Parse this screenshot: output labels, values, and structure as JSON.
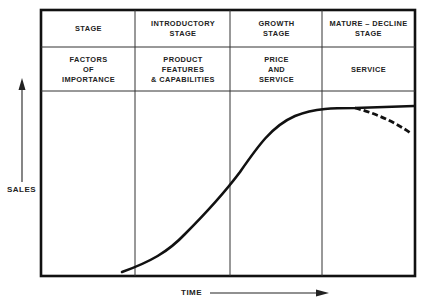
{
  "header_row": {
    "row_label": "STAGE",
    "stages": [
      "INTRODUCTORY\nSTAGE",
      "GROWTH\nSTAGE",
      "MATURE – DECLINE\nSTAGE"
    ]
  },
  "factors_row": {
    "row_label": "FACTORS\nOF\nIMPORTANCE",
    "factors": [
      "PRODUCT\nFEATURES\n& CAPABILITIES",
      "PRICE\nAND\nSERVICE",
      "SERVICE"
    ]
  },
  "axes": {
    "y_label": "SALES",
    "x_label": "TIME"
  },
  "curve": {
    "type": "s-curve",
    "solid_continuation": "plateau",
    "dashed_branch": "decline"
  },
  "colors": {
    "line": "#111111",
    "grid": "#333333",
    "background": "#ffffff"
  }
}
